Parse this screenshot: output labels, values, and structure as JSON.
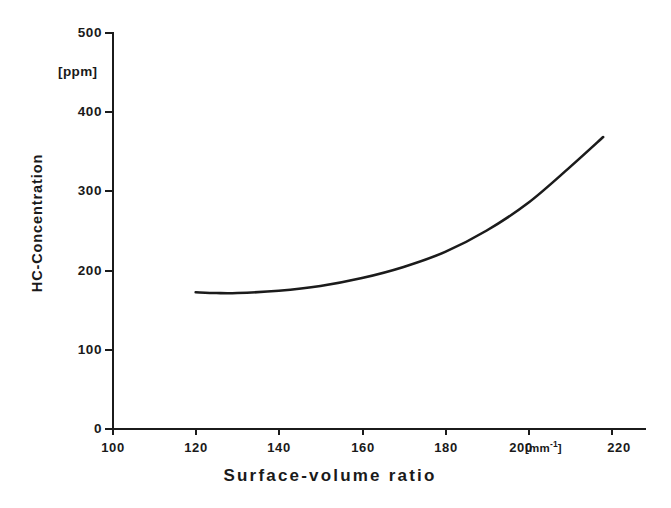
{
  "chart_data": {
    "type": "line",
    "title": "",
    "xlabel": "Surface-volume ratio",
    "ylabel": "HC-Concentration",
    "x_unit": "[mm",
    "x_unit_exponent": "-1",
    "x_unit_close": "]",
    "y_unit": "[ppm]",
    "xlim": [
      100,
      220
    ],
    "ylim": [
      0,
      500
    ],
    "xticks": [
      100,
      120,
      140,
      160,
      180,
      200,
      220
    ],
    "xtick_labels": [
      "100",
      "120",
      "140",
      "160",
      "180",
      "200",
      "220"
    ],
    "yticks": [
      0,
      100,
      200,
      300,
      400,
      500
    ],
    "ytick_labels": [
      "0",
      "100",
      "200",
      "300",
      "400",
      "500"
    ],
    "grid": false,
    "legend": null,
    "series": [
      {
        "name": "HC-Concentration",
        "color": "#1b1b1b",
        "x": [
          120,
          125,
          130,
          140,
          150,
          160,
          170,
          180,
          190,
          200,
          210,
          218
        ],
        "y": [
          172,
          171,
          171,
          174,
          180,
          190,
          204,
          223,
          250,
          285,
          330,
          368
        ]
      }
    ]
  },
  "axes": {
    "y_title": "HC-Concentration",
    "y_unit": "[ppm]",
    "x_title": "Surface-volume ratio"
  }
}
